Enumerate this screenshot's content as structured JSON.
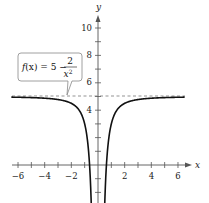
{
  "chart_data": {
    "type": "line",
    "title": "",
    "function": "f(x) = 5 - 2/x^2",
    "xlabel": "x",
    "ylabel": "y",
    "xlim": [
      -6.5,
      6.5
    ],
    "ylim": [
      -2.5,
      10.5
    ],
    "x_ticks": [
      -6,
      -4,
      -2,
      2,
      4,
      6
    ],
    "x_minor_ticks": [
      -6,
      -5,
      -4,
      -3,
      -2,
      -1,
      1,
      2,
      3,
      4,
      5,
      6
    ],
    "y_ticks": [
      4,
      6,
      8,
      10
    ],
    "y_minor_ticks": [
      -2,
      -1,
      1,
      2,
      3,
      4,
      5,
      6,
      7,
      8,
      9,
      10
    ],
    "grid": false,
    "asymptote": {
      "type": "horizontal",
      "y": 5,
      "style": "dashed"
    },
    "vertical_asymptote": {
      "x": 0
    },
    "series": [
      {
        "name": "f(x) = 5 - 2/x^2",
        "x": [
          -6.5,
          -6,
          -5,
          -4,
          -3,
          -2,
          -1.5,
          -1,
          -0.8,
          -0.6,
          -0.5,
          -0.45,
          0.45,
          0.5,
          0.6,
          0.8,
          1,
          1.5,
          2,
          3,
          4,
          5,
          6,
          6.5
        ],
        "values": [
          4.95,
          4.94,
          4.92,
          4.875,
          4.78,
          4.5,
          4.11,
          3.0,
          1.875,
          -0.56,
          -3.0,
          -4.88,
          -4.88,
          -3.0,
          -0.56,
          1.875,
          3.0,
          4.11,
          4.5,
          4.78,
          4.875,
          4.92,
          4.94,
          4.95
        ]
      }
    ],
    "annotations": [
      {
        "text": "f(x) = 5 − 2/x²",
        "points_to": [
          -2.3,
          5
        ]
      }
    ]
  },
  "labels": {
    "x_axis": "x",
    "y_axis": "y",
    "x_tick_labels": [
      "−6",
      "−4",
      "−2",
      "2",
      "4",
      "6"
    ],
    "y_tick_labels": [
      "10",
      "8",
      "6",
      "4"
    ],
    "callout": {
      "lhs_f": "f",
      "lhs_x": "(x)",
      "equals": " = 5 − ",
      "numerator": "2",
      "denominator_x": "x",
      "denominator_exp": "2"
    }
  }
}
